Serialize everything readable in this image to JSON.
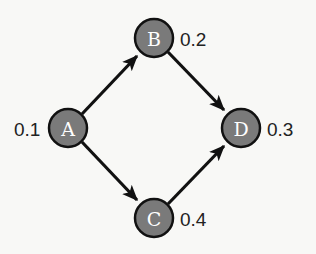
{
  "diagram": {
    "type": "directed-acyclic-graph",
    "colors": {
      "background": "#f8f8f6",
      "node_fill": "#7a7a7a",
      "node_stroke": "#111111",
      "edge": "#111111",
      "node_text": "#ffffff",
      "value_text": "#222222"
    },
    "nodes": [
      {
        "id": "A",
        "label": "A",
        "value": "0.1",
        "cx": 68,
        "cy": 128,
        "value_side": "left"
      },
      {
        "id": "B",
        "label": "B",
        "value": "0.2",
        "cx": 154,
        "cy": 38,
        "value_side": "right"
      },
      {
        "id": "C",
        "label": "C",
        "value": "0.4",
        "cx": 154,
        "cy": 218,
        "value_side": "right"
      },
      {
        "id": "D",
        "label": "D",
        "value": "0.3",
        "cx": 241,
        "cy": 128,
        "value_side": "right"
      }
    ],
    "edges": [
      {
        "from": "A",
        "to": "B"
      },
      {
        "from": "A",
        "to": "C"
      },
      {
        "from": "B",
        "to": "D"
      },
      {
        "from": "C",
        "to": "D"
      }
    ]
  }
}
